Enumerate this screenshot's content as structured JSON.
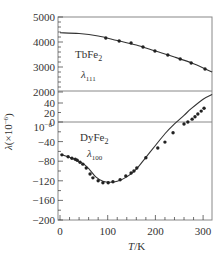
{
  "chart_data": {
    "type": "line",
    "title": "",
    "xlabel": "T/K",
    "ylabel": "λ(×10⁻⁶)",
    "xlim": [
      0,
      319
    ],
    "x_ticks": [
      0,
      100,
      200,
      300
    ],
    "broken_y_axis": true,
    "panels": [
      {
        "name": "upper",
        "ylim": [
          2000,
          5000
        ],
        "y_ticks": [
          2000,
          3000,
          4000,
          5000
        ]
      },
      {
        "name": "lower",
        "ylim": [
          -200,
          45
        ],
        "y_ticks": [
          -200,
          -160,
          -120,
          -80,
          -40,
          0,
          20,
          40
        ]
      }
    ],
    "y_break_label": "10⁻⁶",
    "series": [
      {
        "name": "TbFe2 λ111",
        "material": "TbFe₂",
        "subscript_label": "λ₁₁₁",
        "panel": "upper",
        "curve": [
          [
            0,
            4370
          ],
          [
            40,
            4340
          ],
          [
            80,
            4240
          ],
          [
            120,
            4060
          ],
          [
            160,
            3880
          ],
          [
            200,
            3640
          ],
          [
            240,
            3400
          ],
          [
            280,
            3130
          ],
          [
            319,
            2800
          ]
        ],
        "points": [
          [
            96,
            4160
          ],
          [
            124,
            4040
          ],
          [
            149,
            3960
          ],
          [
            174,
            3800
          ],
          [
            199,
            3640
          ],
          [
            226,
            3480
          ],
          [
            252,
            3320
          ],
          [
            275,
            3160
          ],
          [
            304,
            2920
          ]
        ]
      },
      {
        "name": "DyFe2 λ100",
        "material": "DyFe₂",
        "subscript_label": "λ₁₀₀",
        "panel": "lower",
        "curve": [
          [
            4,
            -67
          ],
          [
            20,
            -72
          ],
          [
            35,
            -78
          ],
          [
            50,
            -86
          ],
          [
            62,
            -97
          ],
          [
            75,
            -112
          ],
          [
            90,
            -121
          ],
          [
            105,
            -123
          ],
          [
            120,
            -121
          ],
          [
            140,
            -112
          ],
          [
            160,
            -96
          ],
          [
            180,
            -72
          ],
          [
            200,
            -48
          ],
          [
            220,
            -24
          ],
          [
            240,
            -4
          ],
          [
            260,
            14
          ],
          [
            275,
            28
          ],
          [
            300,
            48
          ],
          [
            319,
            58
          ]
        ],
        "points": [
          [
            4,
            -67
          ],
          [
            17,
            -71
          ],
          [
            25,
            -74
          ],
          [
            32,
            -76
          ],
          [
            36,
            -78
          ],
          [
            42,
            -82
          ],
          [
            48,
            -86
          ],
          [
            55,
            -94
          ],
          [
            63,
            -106
          ],
          [
            69,
            -114
          ],
          [
            80,
            -120
          ],
          [
            90,
            -124
          ],
          [
            101,
            -124
          ],
          [
            111,
            -122
          ],
          [
            126,
            -118
          ],
          [
            138,
            -110
          ],
          [
            149,
            -104
          ],
          [
            155,
            -100
          ],
          [
            161,
            -94
          ],
          [
            180,
            -73
          ],
          [
            205,
            -53
          ],
          [
            220,
            -41
          ],
          [
            237,
            -22
          ],
          [
            260,
            -4
          ],
          [
            268,
            0
          ],
          [
            277,
            6
          ],
          [
            283,
            11
          ],
          [
            289,
            17
          ],
          [
            296,
            23
          ],
          [
            302,
            29
          ]
        ]
      }
    ],
    "grid": false,
    "legend": "inline labels"
  },
  "labels": {
    "tb_material": "TbFe",
    "tb_sub": "2",
    "tb_lambda": "λ",
    "tb_lambda_sub": "111",
    "dy_material": "DyFe",
    "dy_sub": "2",
    "dy_lambda": "λ",
    "dy_lambda_sub": "100",
    "y_axis_title": "λ(×10",
    "y_axis_exp": "−6",
    "y_axis_close": ")",
    "x_axis_title_italic": "T",
    "x_axis_title_rest": "/K",
    "break_label": "10",
    "break_exp": "−6"
  },
  "colors": {
    "line": "#333333",
    "frame": "#888888",
    "marker": "#222222"
  }
}
